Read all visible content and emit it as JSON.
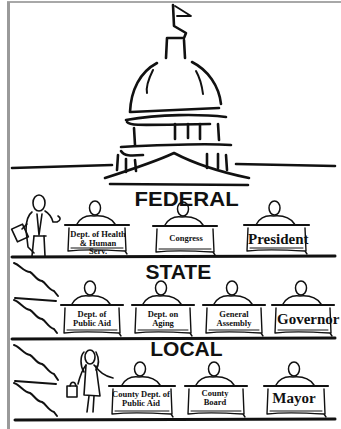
{
  "figure": {
    "levels": [
      {
        "name": "FEDERAL",
        "desks": [
          "Dept. of Health\n& Human Serv.",
          "Congress",
          "President"
        ]
      },
      {
        "name": "STATE",
        "desks": [
          "Dept. of\nPublic Aid",
          "Dept. on\nAging",
          "General\nAssembly",
          "Governor"
        ]
      },
      {
        "name": "LOCAL",
        "desks": [
          "County Dept. of\nPublic Aid",
          "County\nBoard",
          "Mayor"
        ]
      }
    ],
    "labels": {
      "federal": "FEDERAL",
      "state": "STATE",
      "local": "LOCAL",
      "fed_hhs_1": "Dept. of Health",
      "fed_hhs_2": "& Human Serv.",
      "fed_congress": "Congress",
      "fed_president": "President",
      "st_pa_1": "Dept. of",
      "st_pa_2": "Public Aid",
      "st_aging_1": "Dept. on",
      "st_aging_2": "Aging",
      "st_ga_1": "General",
      "st_ga_2": "Assembly",
      "st_governor": "Governor",
      "lc_cdpa_1": "County Dept. of",
      "lc_cdpa_2": "Public Aid",
      "lc_cb_1": "County",
      "lc_cb_2": "Board",
      "lc_mayor": "Mayor"
    }
  }
}
